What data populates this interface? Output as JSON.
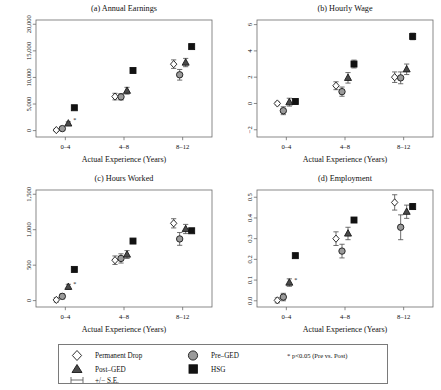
{
  "figure": {
    "xlabel": "Actual Experience (Years)",
    "categories": [
      "0–4",
      "4–8",
      "8–12"
    ]
  },
  "legend": {
    "items": [
      {
        "marker": "diamond-marker",
        "label": "Permanent Drop"
      },
      {
        "marker": "circle-marker",
        "label": "Pre–GED"
      },
      {
        "marker": "triangle-marker",
        "label": "Post–GED"
      },
      {
        "marker": "square-marker",
        "label": "HSG"
      },
      {
        "marker": "errorbar-marker",
        "label": "+/− S.E."
      }
    ],
    "note": "*  p<0.05 (Pre vs. Post)"
  },
  "chart_data": [
    {
      "type": "scatter",
      "panel": "a",
      "title": "(a) Annual Earnings",
      "xlabel": "Actual Experience (Years)",
      "ylabel": "",
      "categories": [
        "0–4",
        "4–8",
        "8–12"
      ],
      "ylim": [
        -1200,
        20800
      ],
      "yticks": [
        0,
        5000,
        10000,
        15000,
        20000
      ],
      "yticklabels": [
        "0",
        "5,000",
        "10,000",
        "15,000",
        "20,000"
      ],
      "grid": false,
      "series": [
        {
          "name": "Permanent Drop",
          "marker": "diamond",
          "values": [
            100,
            6400,
            12500
          ],
          "se": [
            260,
            620,
            800
          ]
        },
        {
          "name": "Pre–GED",
          "marker": "circle",
          "values": [
            380,
            6350,
            10500
          ],
          "se": [
            300,
            600,
            1000
          ]
        },
        {
          "name": "Post–GED",
          "marker": "triangle",
          "values": [
            1350,
            7500,
            12800
          ],
          "se": [
            300,
            640,
            780
          ]
        },
        {
          "name": "HSG",
          "marker": "square",
          "values": [
            4300,
            11300,
            15800
          ],
          "se": [
            120,
            150,
            200
          ]
        }
      ],
      "significance": [
        {
          "category": "0–4",
          "series": "Post–GED",
          "symbol": "*"
        }
      ]
    },
    {
      "type": "scatter",
      "panel": "b",
      "title": "(b) Hourly Wage",
      "xlabel": "Actual Experience (Years)",
      "ylabel": "",
      "categories": [
        "0–4",
        "4–8",
        "8–12"
      ],
      "ylim": [
        -2.55,
        6.35
      ],
      "yticks": [
        -2,
        0,
        2,
        4,
        6
      ],
      "yticklabels": [
        "−2",
        "0",
        "2",
        "4",
        "6"
      ],
      "grid": false,
      "series": [
        {
          "name": "Permanent Drop",
          "marker": "diamond",
          "values": [
            0.0,
            1.35,
            2.0
          ],
          "se": [
            0.1,
            0.3,
            0.4
          ]
        },
        {
          "name": "Pre–GED",
          "marker": "circle",
          "values": [
            -0.55,
            0.9,
            1.95
          ],
          "se": [
            0.3,
            0.35,
            0.45
          ]
        },
        {
          "name": "Post–GED",
          "marker": "triangle",
          "values": [
            0.1,
            1.95,
            2.6
          ],
          "se": [
            0.3,
            0.4,
            0.4
          ]
        },
        {
          "name": "HSG",
          "marker": "square",
          "values": [
            0.15,
            3.0,
            5.1
          ],
          "se": [
            0.2,
            0.3,
            0.25
          ]
        }
      ],
      "significance": []
    },
    {
      "type": "scatter",
      "panel": "c",
      "title": "(c) Hours Worked",
      "xlabel": "Actual Experience (Years)",
      "ylabel": "",
      "categories": [
        "0–4",
        "4–8",
        "8–12"
      ],
      "ylim": [
        -90,
        1560
      ],
      "yticks": [
        0,
        500,
        1000,
        1500
      ],
      "yticklabels": [
        "0",
        "500",
        "1,000",
        "1,500"
      ],
      "grid": false,
      "series": [
        {
          "name": "Permanent Drop",
          "marker": "diamond",
          "values": [
            10,
            570,
            1090
          ],
          "se": [
            30,
            60,
            65
          ]
        },
        {
          "name": "Pre–GED",
          "marker": "circle",
          "values": [
            60,
            595,
            870
          ],
          "se": [
            35,
            65,
            90
          ]
        },
        {
          "name": "Post–GED",
          "marker": "triangle",
          "values": [
            195,
            650,
            1010
          ],
          "se": [
            35,
            55,
            65
          ]
        },
        {
          "name": "HSG",
          "marker": "square",
          "values": [
            440,
            840,
            985
          ],
          "se": [
            15,
            20,
            25
          ]
        }
      ],
      "significance": [
        {
          "category": "0–4",
          "series": "Post–GED",
          "symbol": "*"
        }
      ]
    },
    {
      "type": "scatter",
      "panel": "d",
      "title": "(d) Employment",
      "xlabel": "Actual Experience (Years)",
      "ylabel": "",
      "categories": [
        "0–4",
        "4–8",
        "8–12"
      ],
      "ylim": [
        -0.03,
        0.535
      ],
      "yticks": [
        0.0,
        0.1,
        0.2,
        0.3,
        0.4,
        0.5
      ],
      "yticklabels": [
        "0.0",
        "0.1",
        "0.2",
        "0.3",
        "0.4",
        "0.5"
      ],
      "grid": false,
      "series": [
        {
          "name": "Permanent Drop",
          "marker": "diamond",
          "values": [
            0.002,
            0.3,
            0.475
          ],
          "se": [
            0.012,
            0.033,
            0.037
          ]
        },
        {
          "name": "Pre–GED",
          "marker": "circle",
          "values": [
            0.018,
            0.24,
            0.355
          ],
          "se": [
            0.018,
            0.033,
            0.06
          ]
        },
        {
          "name": "Post–GED",
          "marker": "triangle",
          "values": [
            0.088,
            0.325,
            0.43
          ],
          "se": [
            0.018,
            0.03,
            0.032
          ]
        },
        {
          "name": "HSG",
          "marker": "square",
          "values": [
            0.218,
            0.39,
            0.455
          ],
          "se": [
            0.01,
            0.012,
            0.014
          ]
        }
      ],
      "significance": [
        {
          "category": "0–4",
          "series": "Post–GED",
          "symbol": "*"
        }
      ]
    }
  ]
}
